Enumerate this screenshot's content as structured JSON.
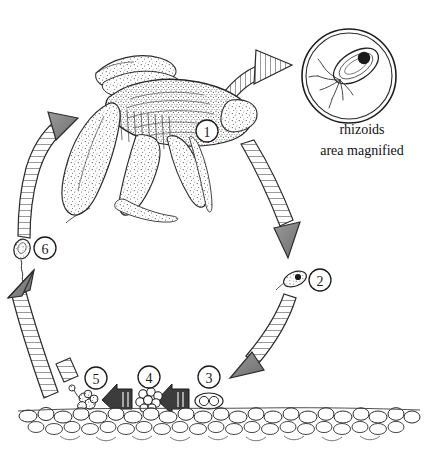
{
  "diagram": {
    "background_color": "#ffffff",
    "ink_color": "#1a1a1a",
    "stage_labels": [
      {
        "id": "1",
        "label": "1",
        "cx": 207,
        "cy": 131,
        "r": 11,
        "description": "mature thallus gametophyte"
      },
      {
        "id": "2",
        "label": "2",
        "cx": 320,
        "cy": 280,
        "r": 11,
        "description": "released spore"
      },
      {
        "id": "3",
        "label": "3",
        "cx": 209,
        "cy": 377,
        "r": 11,
        "description": "two-celled stage"
      },
      {
        "id": "4",
        "label": "4",
        "cx": 149,
        "cy": 377,
        "r": 11,
        "description": "multicellular cell cluster"
      },
      {
        "id": "5",
        "label": "5",
        "cx": 96,
        "cy": 378,
        "r": 11,
        "description": "attached germling on substrate"
      },
      {
        "id": "6",
        "label": "6",
        "cx": 45,
        "cy": 248,
        "r": 11,
        "description": "germinating young thallus"
      }
    ],
    "captions": [
      {
        "name": "rhizoids",
        "text": "rhizoids",
        "x": 362,
        "y": 134,
        "font_size": 14
      },
      {
        "name": "area-magnified",
        "text": "area magnified",
        "x": 362,
        "y": 155,
        "font_size": 14
      }
    ],
    "magnifier": {
      "cx": 349,
      "cy": 76,
      "outer_r": 47,
      "inner_r": 43,
      "content": "magnified cell with nucleus and rhizoid filaments"
    },
    "substrate": {
      "name": "pebble-substrate",
      "y": 408,
      "height": 36,
      "description": "layer of rounded pebbles / sediment"
    },
    "organism": {
      "name": "thallus-gametophyte",
      "description": "stippled lobed thallus body with projecting lobes"
    },
    "arrows": [
      {
        "name": "arrow-thallus-to-magnifier",
        "style": "hatched",
        "direction": "right"
      },
      {
        "name": "arrow-stage1-to-stage2",
        "style": "hatched",
        "direction": "down-right"
      },
      {
        "name": "arrow-stage2-to-stage3",
        "style": "hatched",
        "direction": "down-left"
      },
      {
        "name": "arrow-stage3-to-stage4",
        "style": "solid-hatched",
        "direction": "left"
      },
      {
        "name": "arrow-stage4-to-stage5",
        "style": "solid-hatched",
        "direction": "left"
      },
      {
        "name": "arrow-stage5-to-stage6",
        "style": "hatched",
        "direction": "up-left"
      },
      {
        "name": "arrow-stage6-to-stage1",
        "style": "hatched",
        "direction": "up-right"
      }
    ]
  }
}
